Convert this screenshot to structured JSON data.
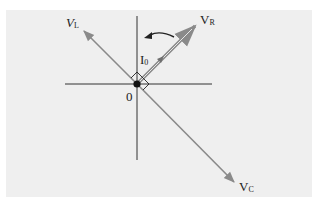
{
  "diagram": {
    "type": "phasor-diagram",
    "origin_label": "0",
    "rotation_direction": "counterclockwise",
    "colors": {
      "panel_background": "#efefef",
      "axis": "#333333",
      "phasor": "#8a8a8a",
      "origin_dot": "#111111"
    },
    "phasors": [
      {
        "id": "VL",
        "symbol": "V",
        "subscript": "L",
        "direction": "upper-left"
      },
      {
        "id": "VR",
        "symbol": "V",
        "subscript": "R",
        "direction": "upper-right"
      },
      {
        "id": "I0",
        "symbol": "I",
        "subscript": "0",
        "direction": "upper-right"
      },
      {
        "id": "VC",
        "symbol": "V",
        "subscript": "C",
        "direction": "lower-right"
      }
    ]
  },
  "labels": {
    "vl_main": "V",
    "vl_sub": "L",
    "vr_main": "V",
    "vr_sub": "R",
    "i0_main": "I",
    "i0_sub": "0",
    "vc_main": "V",
    "vc_sub": "C",
    "origin": "0"
  }
}
